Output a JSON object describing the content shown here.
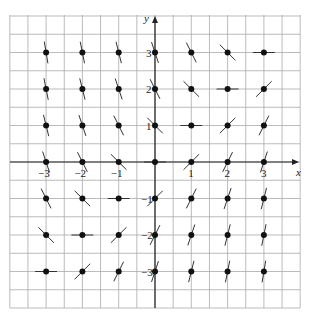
{
  "chart_data": {
    "type": "slope_field",
    "title": "",
    "equation_implied": "dy/dx = x - y",
    "xlabel": "x",
    "ylabel": "y",
    "xlim": [
      -4,
      4
    ],
    "ylim": [
      -4,
      4
    ],
    "grid": true,
    "grid_step": 0.5,
    "x_ticks": [
      -3,
      -2,
      -1,
      1,
      2,
      3
    ],
    "y_ticks": [
      -3,
      -2,
      -1,
      1,
      2,
      3
    ],
    "x_tick_labels": [
      "−3",
      "−2",
      "−1",
      "1",
      "2",
      "3"
    ],
    "y_tick_labels": [
      "−3",
      "−2",
      "−1",
      "1",
      "2",
      "3"
    ],
    "points_x": [
      -3,
      -2,
      -1,
      0,
      1,
      2,
      3
    ],
    "points_y": [
      -3,
      -2,
      -1,
      0,
      1,
      2,
      3
    ]
  },
  "layout": {
    "grid_left": 10,
    "grid_top": 15,
    "grid_right": 300,
    "grid_bottom": 308,
    "origin_x": 155,
    "origin_y": 162,
    "unit_x": 36.3,
    "unit_y": 36.5,
    "segment_half_length": 11
  },
  "colors": {
    "grid": "#aaaaaa",
    "axis": "#222222",
    "segment": "#333333",
    "dot": "#111111"
  }
}
